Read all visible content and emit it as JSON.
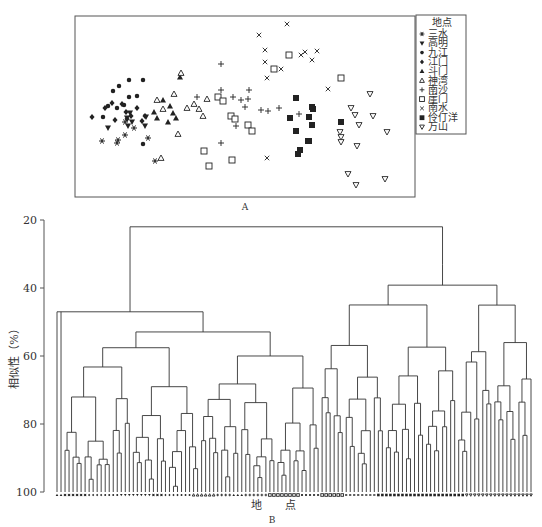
{
  "chart_data": [
    {
      "type": "scatter",
      "panel_label": "A",
      "title": "",
      "xlabel": "",
      "ylabel": "",
      "grid": false,
      "legend_position": "right",
      "legend_title": "地点",
      "series": [
        {
          "name": "三水",
          "marker": "asterisk",
          "points": [
            [
              125,
              122
            ],
            [
              118,
              140
            ],
            [
              102,
              141
            ],
            [
              117,
              143
            ],
            [
              148,
              138
            ],
            [
              155,
              161
            ],
            [
              134,
              128
            ],
            [
              125,
              135
            ]
          ]
        },
        {
          "name": "高明",
          "marker": "triangle-down-filled",
          "points": [
            [
              130,
              113
            ],
            [
              127,
              118
            ],
            [
              132,
              122
            ],
            [
              146,
              117
            ],
            [
              128,
              126
            ],
            [
              108,
              128
            ],
            [
              145,
              126
            ]
          ]
        },
        {
          "name": "九江",
          "marker": "circle-filled",
          "points": [
            [
              129,
              80
            ],
            [
              143,
              80
            ],
            [
              119,
              86
            ],
            [
              113,
              91
            ],
            [
              129,
              97
            ],
            [
              137,
              96
            ],
            [
              108,
              106
            ],
            [
              103,
              117
            ],
            [
              143,
              144
            ],
            [
              124,
              105
            ],
            [
              117,
              108
            ]
          ]
        },
        {
          "name": "江门",
          "marker": "diamond-filled",
          "points": [
            [
              92,
              117
            ],
            [
              105,
              108
            ],
            [
              112,
              103
            ],
            [
              122,
              104
            ],
            [
              127,
              119
            ],
            [
              131,
              116
            ],
            [
              126,
              112
            ],
            [
              115,
              120
            ],
            [
              137,
              108
            ],
            [
              145,
              116
            ],
            [
              142,
              121
            ]
          ]
        },
        {
          "name": "斗门",
          "marker": "triangle-up-filled",
          "points": [
            [
              180,
              77
            ],
            [
              163,
              100
            ],
            [
              170,
              106
            ],
            [
              173,
              113
            ],
            [
              176,
              118
            ],
            [
              168,
              122
            ],
            [
              154,
              112
            ],
            [
              157,
              118
            ]
          ]
        },
        {
          "name": "神湾",
          "marker": "triangle-up",
          "points": [
            [
              181,
              73
            ],
            [
              157,
              100
            ],
            [
              174,
              94
            ],
            [
              163,
              109
            ],
            [
              187,
              108
            ],
            [
              194,
              104
            ],
            [
              199,
              109
            ],
            [
              207,
              99
            ],
            [
              203,
              116
            ],
            [
              178,
              134
            ],
            [
              161,
              158
            ]
          ]
        },
        {
          "name": "南沙",
          "marker": "plus",
          "points": [
            [
              221,
              64
            ],
            [
              221,
              90
            ],
            [
              197,
              97
            ],
            [
              249,
              90
            ],
            [
              233,
              97
            ],
            [
              241,
              100
            ],
            [
              245,
              107
            ],
            [
              261,
              110
            ],
            [
              279,
              108
            ],
            [
              248,
              99
            ],
            [
              268,
              111
            ],
            [
              221,
              143
            ],
            [
              299,
              114
            ],
            [
              236,
              126
            ]
          ]
        },
        {
          "name": "崖门",
          "marker": "square",
          "points": [
            [
              218,
              97
            ],
            [
              223,
              101
            ],
            [
              231,
              116
            ],
            [
              235,
              119
            ],
            [
              248,
              125
            ],
            [
              252,
              131
            ],
            [
              204,
              151
            ],
            [
              209,
              166
            ],
            [
              232,
              160
            ],
            [
              289,
              55
            ],
            [
              274,
              69
            ],
            [
              341,
              78
            ]
          ]
        },
        {
          "name": "南水",
          "marker": "cross",
          "points": [
            [
              287,
              24
            ],
            [
              259,
              35
            ],
            [
              265,
              50
            ],
            [
              265,
              62
            ],
            [
              281,
              69
            ],
            [
              267,
              78
            ],
            [
              305,
              52
            ],
            [
              301,
              55
            ],
            [
              312,
              60
            ],
            [
              317,
              51
            ],
            [
              328,
              89
            ],
            [
              267,
              158
            ]
          ]
        },
        {
          "name": "伶仃洋",
          "marker": "square-filled",
          "points": [
            [
              296,
              98
            ],
            [
              312,
              107
            ],
            [
              313,
              109
            ],
            [
              290,
              118
            ],
            [
              309,
              117
            ],
            [
              312,
              125
            ],
            [
              296,
              131
            ],
            [
              309,
              141
            ],
            [
              308,
              141
            ],
            [
              300,
              150
            ],
            [
              298,
              154
            ],
            [
              341,
              122
            ]
          ]
        },
        {
          "name": "万山",
          "marker": "triangle-down",
          "points": [
            [
              370,
              94
            ],
            [
              351,
              108
            ],
            [
              355,
              115
            ],
            [
              373,
              116
            ],
            [
              359,
              125
            ],
            [
              340,
              132
            ],
            [
              341,
              137
            ],
            [
              341,
              142
            ],
            [
              357,
              146
            ],
            [
              387,
              132
            ],
            [
              348,
              174
            ],
            [
              356,
              185
            ],
            [
              385,
              179
            ]
          ]
        }
      ],
      "xlim": [
        75,
        415
      ],
      "ylim": [
        16,
        197
      ],
      "note": "points given in panel pixel coordinates (unitless ordination axes, no ticks shown)"
    },
    {
      "type": "dendrogram",
      "panel_label": "B",
      "title": "",
      "xlabel": "地  点",
      "ylabel": "相似性（%）",
      "ylim": [
        20,
        100
      ],
      "y_ticks": [
        20,
        40,
        60,
        80,
        100
      ],
      "y_tick_labels": [
        "20",
        "40",
        "60",
        "80",
        "100"
      ],
      "leaf_count": 119,
      "root_similarity": 22,
      "main_clusters": [
        {
          "name": "left cluster (三水/高明/九江/江门/斗门/神湾/南沙)",
          "join_similarity": 47
        },
        {
          "name": "right cluster (崖门/南水/伶仃洋/万山)",
          "join_similarity": 33
        }
      ],
      "notable_merge_levels": [
        22,
        33,
        36,
        38,
        42,
        44,
        46,
        47,
        49,
        53,
        54,
        56,
        57,
        58,
        60,
        62,
        63,
        64,
        65,
        66,
        68,
        70,
        72,
        73,
        75,
        79,
        83,
        85,
        88
      ]
    }
  ],
  "figure": {
    "panel_a_label": "A",
    "panel_b_label": "B",
    "legend": {
      "title": "地点",
      "items": [
        {
          "label": "三水",
          "icon": "asterisk-icon"
        },
        {
          "label": "高明",
          "icon": "triangle-down-filled-icon"
        },
        {
          "label": "九江",
          "icon": "circle-filled-icon"
        },
        {
          "label": "江门",
          "icon": "diamond-filled-icon"
        },
        {
          "label": "斗门",
          "icon": "triangle-up-filled-icon"
        },
        {
          "label": "神湾",
          "icon": "triangle-up-icon"
        },
        {
          "label": "南沙",
          "icon": "plus-icon"
        },
        {
          "label": "崖门",
          "icon": "square-icon"
        },
        {
          "label": "南水",
          "icon": "cross-icon"
        },
        {
          "label": "伶仃洋",
          "icon": "square-filled-icon"
        },
        {
          "label": "万山",
          "icon": "triangle-down-icon"
        }
      ]
    },
    "dendro_ylabel": "相似性（%）",
    "dendro_xlabel_1": "地",
    "dendro_xlabel_2": "点",
    "ticks": [
      "20",
      "40",
      "60",
      "80",
      "100"
    ]
  }
}
